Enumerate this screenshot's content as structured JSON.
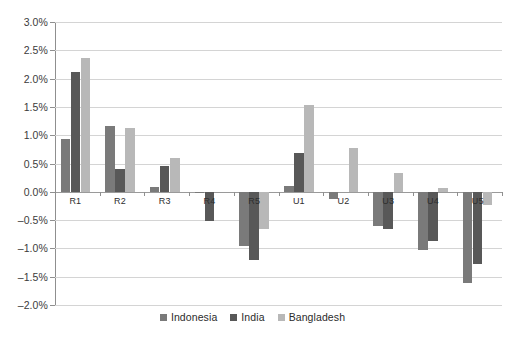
{
  "chart_data": {
    "type": "bar",
    "title": "",
    "subtitle": "",
    "xlabel": "",
    "ylabel": "",
    "ylim": [
      -2.0,
      3.0
    ],
    "ytick_step": 0.5,
    "ytick_labels": [
      "3.0%",
      "2.5%",
      "2.0%",
      "1.5%",
      "1.0%",
      "0.5%",
      "0.0%",
      "–0.5%",
      "–1.0%",
      "–1.5%",
      "–2.0%"
    ],
    "ytick_values": [
      3.0,
      2.5,
      2.0,
      1.5,
      1.0,
      0.5,
      0.0,
      -0.5,
      -1.0,
      -1.5,
      -2.0
    ],
    "grid": true,
    "legend_position": "bottom",
    "value_unit": "percent",
    "categories": [
      "R1",
      "R2",
      "R3",
      "R4",
      "R5",
      "U1",
      "U2",
      "U3",
      "U4",
      "U5"
    ],
    "series": [
      {
        "name": "Indonesia",
        "color": "#7a7a7a",
        "values": [
          0.94,
          1.17,
          0.08,
          -0.02,
          -0.95,
          0.1,
          -0.13,
          -0.6,
          -1.02,
          -1.61
        ]
      },
      {
        "name": "India",
        "color": "#585858",
        "values": [
          2.12,
          0.4,
          0.46,
          -0.52,
          -1.21,
          0.68,
          0.0,
          -0.66,
          -0.87,
          -1.28
        ]
      },
      {
        "name": "Bangladesh",
        "color": "#b8b8b8",
        "values": [
          2.37,
          1.13,
          0.59,
          0.0,
          -0.65,
          1.54,
          0.77,
          0.33,
          0.07,
          -0.23
        ]
      }
    ]
  },
  "colors": {
    "gridline": "#d4d4d4",
    "axis": "#8f8f8f",
    "zero_line": "#9a9a9a",
    "text": "#2e2e2e",
    "background": "#ffffff"
  }
}
